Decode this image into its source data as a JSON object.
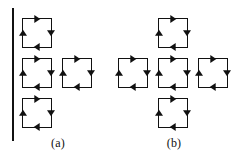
{
  "figure": {
    "width": 232,
    "height": 158,
    "background_color": "#ffffff",
    "ink_color": "#111111"
  },
  "panels": [
    {
      "id": "a",
      "label": "(a)",
      "label_x": 58,
      "label_y": 136,
      "boundary_line": {
        "present": true,
        "orientation": "vertical",
        "x": 12,
        "y_top": 8,
        "y_bottom": 141,
        "thickness": 2.2,
        "color": "#111111"
      },
      "loop_size": 30,
      "loops": [
        {
          "name": "loop-a1",
          "row": 0,
          "col": 0,
          "x": 22,
          "y": 18,
          "direction": "clockwise"
        },
        {
          "name": "loop-a2",
          "row": 1,
          "col": 0,
          "x": 22,
          "y": 58,
          "direction": "clockwise"
        },
        {
          "name": "loop-a3",
          "row": 1,
          "col": 1,
          "x": 62,
          "y": 58,
          "direction": "clockwise"
        },
        {
          "name": "loop-a4",
          "row": 2,
          "col": 0,
          "x": 22,
          "y": 98,
          "direction": "clockwise"
        }
      ]
    },
    {
      "id": "b",
      "label": "(b)",
      "label_x": 56,
      "label_y": 136,
      "boundary_line": {
        "present": false
      },
      "loop_size": 30,
      "loops": [
        {
          "name": "loop-b-top",
          "row": 0,
          "col": 1,
          "x": 42,
          "y": 18,
          "direction": "clockwise"
        },
        {
          "name": "loop-b-left",
          "row": 1,
          "col": 0,
          "x": 2,
          "y": 58,
          "direction": "clockwise"
        },
        {
          "name": "loop-b-center",
          "row": 1,
          "col": 1,
          "x": 42,
          "y": 58,
          "direction": "clockwise"
        },
        {
          "name": "loop-b-right",
          "row": 1,
          "col": 2,
          "x": 82,
          "y": 58,
          "direction": "clockwise"
        },
        {
          "name": "loop-b-bottom",
          "row": 2,
          "col": 1,
          "x": 42,
          "y": 98,
          "direction": "clockwise"
        }
      ]
    }
  ],
  "arrow_edges": [
    {
      "edge": "top",
      "points": "right",
      "icon": "arrow-right-icon"
    },
    {
      "edge": "right",
      "points": "down",
      "icon": "arrow-down-icon"
    },
    {
      "edge": "bottom",
      "points": "left",
      "icon": "arrow-left-icon"
    },
    {
      "edge": "left",
      "points": "up",
      "icon": "arrow-up-icon"
    }
  ]
}
